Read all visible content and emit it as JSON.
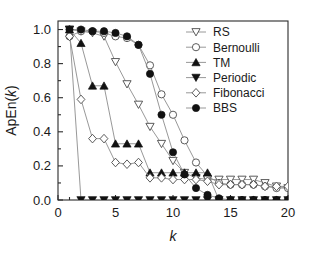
{
  "chart_data": {
    "type": "line",
    "title": "",
    "subtitle": "",
    "xlabel": "k",
    "ylabel": "ApEn(k)",
    "xlim": [
      0,
      20
    ],
    "ylim": [
      0.0,
      1.05
    ],
    "grid": false,
    "legend_position": "top-right",
    "x_ticks": [
      "0",
      "5",
      "10",
      "15",
      "20"
    ],
    "x_tick_values": [
      0,
      5,
      10,
      15,
      20
    ],
    "y_ticks": [
      "0.0",
      "0.2",
      "0.4",
      "0.6",
      "0.8",
      "1.0"
    ],
    "y_tick_values": [
      0.0,
      0.2,
      0.4,
      0.6,
      0.8,
      1.0
    ],
    "x": [
      1,
      2,
      3,
      4,
      5,
      6,
      7,
      8,
      9,
      10,
      11,
      12,
      13,
      14,
      15,
      16,
      17,
      18,
      19,
      20
    ],
    "series": [
      {
        "name": "RS",
        "marker": "open-triangle-down",
        "values": [
          1.0,
          0.99,
          0.98,
          0.96,
          0.81,
          0.68,
          0.56,
          0.43,
          0.33,
          0.23,
          0.16,
          0.13,
          0.12,
          0.12,
          0.12,
          0.12,
          0.12,
          0.1,
          0.08,
          0.07
        ]
      },
      {
        "name": "Bernoulli",
        "marker": "open-circle",
        "values": [
          0.96,
          0.99,
          0.99,
          0.98,
          0.96,
          0.95,
          0.91,
          0.79,
          0.62,
          0.5,
          0.35,
          0.22,
          0.14,
          0.1,
          0.09,
          0.09,
          0.09,
          0.08,
          0.07,
          0.07
        ]
      },
      {
        "name": "TM",
        "marker": "filled-triangle-up",
        "values": [
          1.0,
          0.92,
          0.67,
          0.67,
          0.33,
          0.33,
          0.33,
          0.16,
          0.16,
          0.16,
          0.16,
          0.16,
          0.16,
          0.0,
          0.0,
          0.0,
          0.0,
          0.0,
          0.0,
          0.0
        ]
      },
      {
        "name": "Periodic",
        "marker": "filled-triangle-down",
        "values": [
          1.0,
          0.0,
          0.0,
          0.0,
          0.0,
          0.0,
          0.0,
          0.0,
          0.0,
          0.0,
          0.0,
          0.0,
          0.0,
          0.0,
          0.0,
          0.0,
          0.0,
          0.0,
          0.0,
          0.0
        ]
      },
      {
        "name": "Fibonacci",
        "marker": "open-diamond",
        "values": [
          0.96,
          0.59,
          0.36,
          0.36,
          0.22,
          0.21,
          0.22,
          0.13,
          0.13,
          0.12,
          0.12,
          0.12,
          0.11,
          0.09,
          0.09,
          0.09,
          0.09,
          0.08,
          0.08,
          0.08
        ]
      },
      {
        "name": "BBS",
        "marker": "filled-circle",
        "values": [
          1.0,
          1.0,
          0.99,
          0.99,
          0.98,
          0.96,
          0.91,
          0.74,
          0.5,
          0.28,
          0.15,
          0.07,
          0.03,
          0.01,
          0.0,
          0.0,
          0.0,
          0.0,
          0.0,
          0.0
        ]
      }
    ]
  },
  "legend": {
    "entries": [
      {
        "label": "RS"
      },
      {
        "label": "Bernoulli"
      },
      {
        "label": "TM"
      },
      {
        "label": "Periodic"
      },
      {
        "label": "Fibonacci"
      },
      {
        "label": "BBS"
      }
    ]
  },
  "colors": {
    "axis": "#2b2b2b",
    "line": "#8c8c8c",
    "marker_fill": "#111111",
    "marker_open": "#ffffff",
    "background": "#ffffff"
  }
}
